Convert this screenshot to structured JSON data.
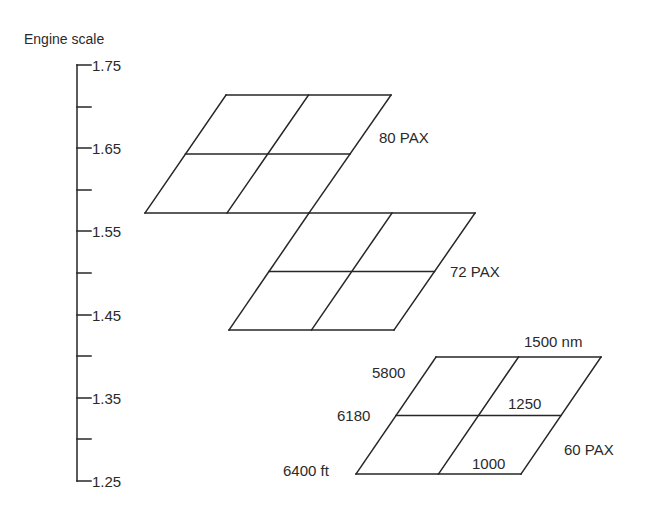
{
  "axis": {
    "title": "Engine scale",
    "title_pos": {
      "x": 24,
      "y": 44
    },
    "line_x": 77,
    "tick_len_major": 14,
    "tick_len_minor": 14,
    "value_min": 1.25,
    "value_max": 1.75,
    "y_at_min": 481,
    "y_at_max": 65,
    "ticks": [
      {
        "value": 1.75,
        "label": "1.75",
        "major": true
      },
      {
        "value": 1.7,
        "label": "",
        "major": false
      },
      {
        "value": 1.65,
        "label": "1.65",
        "major": true
      },
      {
        "value": 1.6,
        "label": "",
        "major": false
      },
      {
        "value": 1.55,
        "label": "1.55",
        "major": true
      },
      {
        "value": 1.5,
        "label": "",
        "major": false
      },
      {
        "value": 1.45,
        "label": "1.45",
        "major": true
      },
      {
        "value": 1.4,
        "label": "",
        "major": false
      },
      {
        "value": 1.35,
        "label": "1.35",
        "major": true
      },
      {
        "value": 1.3,
        "label": "",
        "major": false
      },
      {
        "value": 1.25,
        "label": "1.25",
        "major": true
      }
    ]
  },
  "grids": [
    {
      "name": "80 PAX",
      "label": "80 PAX",
      "label_pos": {
        "x": 379,
        "y": 143
      },
      "top": {
        "y": 95,
        "x_left": 226,
        "x_right": 391
      },
      "bottom": {
        "y": 213,
        "x_left": 145,
        "x_right": 309
      }
    },
    {
      "name": "72 PAX",
      "label": "72 PAX",
      "label_pos": {
        "x": 450,
        "y": 277
      },
      "top": {
        "y": 213,
        "x_left": 309,
        "x_right": 475
      },
      "bottom": {
        "y": 330,
        "x_left": 229,
        "x_right": 394
      }
    },
    {
      "name": "60 PAX",
      "label": "60 PAX",
      "label_pos": {
        "x": 564,
        "y": 455
      },
      "top": {
        "y": 357,
        "x_left": 436,
        "x_right": 601
      },
      "bottom": {
        "y": 474,
        "x_left": 356,
        "x_right": 521
      }
    }
  ],
  "annotations": [
    {
      "text": "1500 nm",
      "x": 524,
      "y": 347,
      "meaning": "range top line"
    },
    {
      "text": "1250",
      "x": 508,
      "y": 409,
      "meaning": "range middle line"
    },
    {
      "text": "1000",
      "x": 472,
      "y": 469,
      "meaning": "range bottom line"
    },
    {
      "text": "5800",
      "x": 372,
      "y": 378,
      "meaning": "field length top"
    },
    {
      "text": "6180",
      "x": 337,
      "y": 421,
      "meaning": "field length middle"
    },
    {
      "text": "6400 ft",
      "x": 283,
      "y": 476,
      "meaning": "field length bottom"
    }
  ],
  "chart_data": {
    "type": "carpet-plot",
    "title": "",
    "ylabel": "Engine scale",
    "ylim": [
      1.25,
      1.75
    ],
    "yticks": [
      1.25,
      1.35,
      1.45,
      1.55,
      1.65,
      1.75
    ],
    "minor_yticks": [
      1.3,
      1.4,
      1.5,
      1.6,
      1.7
    ],
    "range_nm": [
      1000,
      1250,
      1500
    ],
    "field_length_ft": [
      6400,
      6180,
      5800
    ],
    "series": [
      {
        "name": "80 PAX",
        "engine_scale_range": [
          1.57,
          1.72
        ]
      },
      {
        "name": "72 PAX",
        "engine_scale_range": [
          1.43,
          1.57
        ]
      },
      {
        "name": "60 PAX",
        "engine_scale_range": [
          1.25,
          1.4
        ]
      }
    ]
  }
}
